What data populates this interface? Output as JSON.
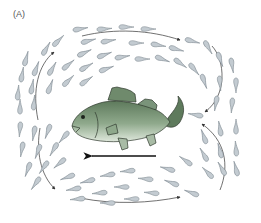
{
  "figure": {
    "panel_label": "(A)",
    "colors": {
      "background": "#ffffff",
      "particle_fill": "#c3cbd1",
      "particle_stroke": "#7f8a92",
      "flow_line": "#333333",
      "fish_dark": "#5e7a5c",
      "fish_light": "#dfe8dc",
      "fish_outline": "#2f3a2e",
      "swim_arrow": "#111111"
    },
    "swim_direction": "left",
    "flow_arrows": [
      {
        "name": "top-left",
        "direction": "up-right"
      },
      {
        "name": "top",
        "direction": "right"
      },
      {
        "name": "right-upper",
        "direction": "down-left"
      },
      {
        "name": "right-lower",
        "direction": "up-left"
      },
      {
        "name": "bottom-left",
        "direction": "down-right"
      },
      {
        "name": "bottom",
        "direction": "right"
      }
    ]
  }
}
